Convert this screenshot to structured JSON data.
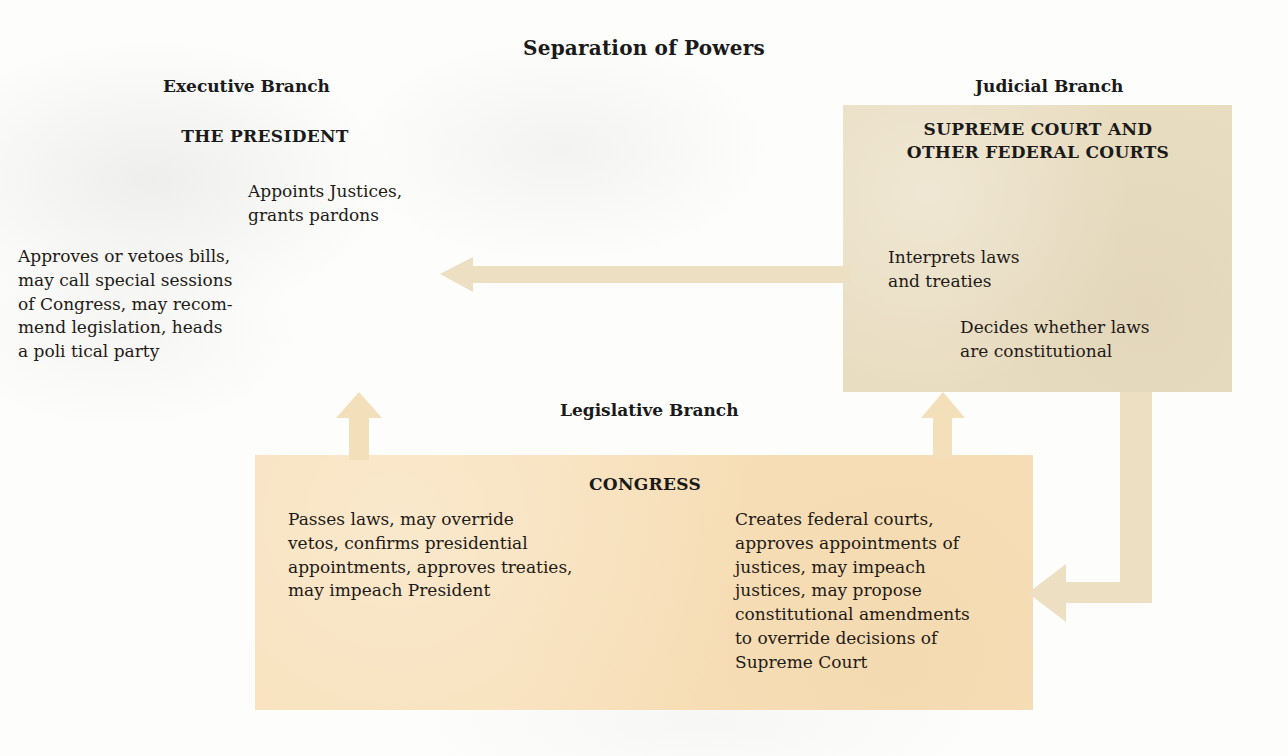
{
  "title": "Separation of Powers",
  "palette": {
    "page_background": "#fdfdfb",
    "judicial_box": "#e9ddc1",
    "congress_box": "#f8e0b9",
    "arrow_light": "#f3dfba",
    "arrow_tan": "#ecdfc2",
    "text": "#1a1a1a"
  },
  "branches": {
    "executive": {
      "label": "Executive Branch",
      "org_title": "THE PRESIDENT",
      "powers": [
        "Appoints Justices,\ngrants pardons",
        "Approves or vetoes bills,\nmay call special sessions\nof Congress, may recom-\nmend legislation, heads\n a poli tical party"
      ]
    },
    "judicial": {
      "label": "Judicial Branch",
      "org_title": "SUPREME COURT AND\nOTHER FEDERAL COURTS",
      "powers": [
        "Interprets laws\nand treaties",
        "Decides whether laws\nare constitutional"
      ]
    },
    "legislative": {
      "label": "Legislative Branch",
      "org_title": "CONGRESS",
      "powers": [
        "Passes laws, may override\nvetos, confirms presidential\nappointments, approves treaties,\nmay impeach President",
        "Creates federal courts,\napproves appointments of\njustices, may impeach\njustices, may propose\nconstitutional amendments\nto override decisions of\nSupreme Court"
      ]
    }
  },
  "arrows": [
    {
      "name": "judicial-to-executive",
      "from": "Judicial Branch",
      "to": "Executive Branch",
      "direction": "left"
    },
    {
      "name": "legislative-to-executive",
      "from": "Legislative Branch",
      "to": "Executive Branch",
      "direction": "up"
    },
    {
      "name": "legislative-to-judicial",
      "from": "Legislative Branch",
      "to": "Judicial Branch",
      "direction": "up"
    },
    {
      "name": "judicial-to-legislative",
      "from": "Judicial Branch",
      "to": "Legislative Branch",
      "direction": "down-left"
    }
  ]
}
